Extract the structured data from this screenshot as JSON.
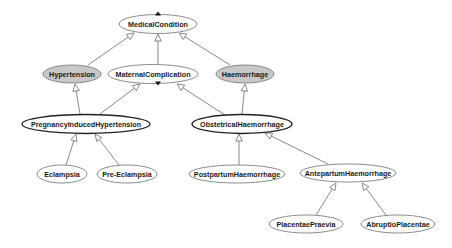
{
  "diagram": {
    "type": "class-hierarchy",
    "colors": {
      "background": "#ffffff",
      "node_fill_default": "#ffffff",
      "node_fill_highlight": "#c8c8c8",
      "node_stroke": "#6e6e6e",
      "node_stroke_emphasis": "#222222",
      "edge": "#6a6a6a",
      "text": "#1a1a1a"
    },
    "nodes": [
      {
        "id": "medical-condition",
        "label": "MedicalCondition",
        "cx": 158,
        "cy": 24,
        "rx": 39,
        "ry": 9.5,
        "fill": "#ffffff",
        "emphasis": false,
        "marker": "up"
      },
      {
        "id": "hypertension",
        "label": "Hypertension",
        "cx": 72,
        "cy": 74,
        "rx": 29,
        "ry": 9,
        "fill": "#c8c8c8",
        "emphasis": false
      },
      {
        "id": "maternal-complication",
        "label": "MaternalComplication",
        "cx": 153,
        "cy": 74,
        "rx": 45,
        "ry": 9.5,
        "fill": "#ffffff",
        "emphasis": false,
        "marker": "down"
      },
      {
        "id": "haemorrhage",
        "label": "Haemorrhage",
        "cx": 245,
        "cy": 74,
        "rx": 29,
        "ry": 9,
        "fill": "#c8c8c8",
        "emphasis": false
      },
      {
        "id": "pregnancy-induced-hypertension",
        "label": "PregnancyInducedHypertension",
        "cx": 86,
        "cy": 124,
        "rx": 64,
        "ry": 9.5,
        "fill": "#ffffff",
        "emphasis": true
      },
      {
        "id": "obstetrical-haemorrhage",
        "label": "ObstetricalHaemorrhage",
        "cx": 242,
        "cy": 124,
        "rx": 50,
        "ry": 9.5,
        "fill": "#ffffff",
        "emphasis": true
      },
      {
        "id": "eclampsia",
        "label": "Eclampsia",
        "cx": 62,
        "cy": 174,
        "rx": 25,
        "ry": 9,
        "fill": "#ffffff",
        "emphasis": false
      },
      {
        "id": "pre-eclampsia",
        "label": "Pre-Eclampsia",
        "cx": 127,
        "cy": 174,
        "rx": 30,
        "ry": 9,
        "fill": "#ffffff",
        "emphasis": false
      },
      {
        "id": "postpartum-haemorrhage",
        "label": "PostpartumHaemorrhage",
        "cx": 237,
        "cy": 174,
        "rx": 48,
        "ry": 9,
        "fill": "#ffffff",
        "emphasis": false
      },
      {
        "id": "antepartum-haemorrhage",
        "label": "AntepartumHaemorrhage",
        "cx": 348,
        "cy": 173,
        "rx": 48,
        "ry": 9,
        "fill": "#ffffff",
        "emphasis": false
      },
      {
        "id": "placentae-praevia",
        "label": "PlacentaePraevia",
        "cx": 306,
        "cy": 224,
        "rx": 37,
        "ry": 9,
        "fill": "#ffffff",
        "emphasis": false
      },
      {
        "id": "abruptio-placentae",
        "label": "AbruptioPlacentae",
        "cx": 398,
        "cy": 224,
        "rx": 37,
        "ry": 9,
        "fill": "#ffffff",
        "emphasis": false
      }
    ],
    "edges": [
      {
        "from": "hypertension",
        "to": "medical-condition",
        "x1": 88,
        "y1": 65,
        "x2": 134,
        "y2": 33
      },
      {
        "from": "maternal-complication",
        "to": "medical-condition",
        "x1": 158,
        "y1": 64,
        "x2": 158,
        "y2": 34
      },
      {
        "from": "haemorrhage",
        "to": "medical-condition",
        "x1": 230,
        "y1": 65,
        "x2": 179,
        "y2": 33
      },
      {
        "from": "pregnancy-induced-hypertension",
        "to": "hypertension",
        "x1": 80,
        "y1": 114,
        "x2": 75,
        "y2": 84
      },
      {
        "from": "pregnancy-induced-hypertension",
        "to": "maternal-complication",
        "x1": 100,
        "y1": 114,
        "x2": 140,
        "y2": 84
      },
      {
        "from": "obstetrical-haemorrhage",
        "to": "maternal-complication",
        "x1": 225,
        "y1": 115,
        "x2": 177,
        "y2": 84
      },
      {
        "from": "obstetrical-haemorrhage",
        "to": "haemorrhage",
        "x1": 242,
        "y1": 114,
        "x2": 245,
        "y2": 84
      },
      {
        "from": "eclampsia",
        "to": "pregnancy-induced-hypertension",
        "x1": 66,
        "y1": 165,
        "x2": 76,
        "y2": 134
      },
      {
        "from": "pre-eclampsia",
        "to": "pregnancy-induced-hypertension",
        "x1": 119,
        "y1": 165,
        "x2": 95,
        "y2": 134
      },
      {
        "from": "postpartum-haemorrhage",
        "to": "obstetrical-haemorrhage",
        "x1": 239,
        "y1": 165,
        "x2": 239,
        "y2": 134
      },
      {
        "from": "antepartum-haemorrhage",
        "to": "obstetrical-haemorrhage",
        "x1": 328,
        "y1": 164,
        "x2": 265,
        "y2": 133
      },
      {
        "from": "placentae-praevia",
        "to": "antepartum-haemorrhage",
        "x1": 316,
        "y1": 215,
        "x2": 336,
        "y2": 183
      },
      {
        "from": "abruptio-placentae",
        "to": "antepartum-haemorrhage",
        "x1": 386,
        "y1": 215,
        "x2": 362,
        "y2": 183
      }
    ]
  }
}
